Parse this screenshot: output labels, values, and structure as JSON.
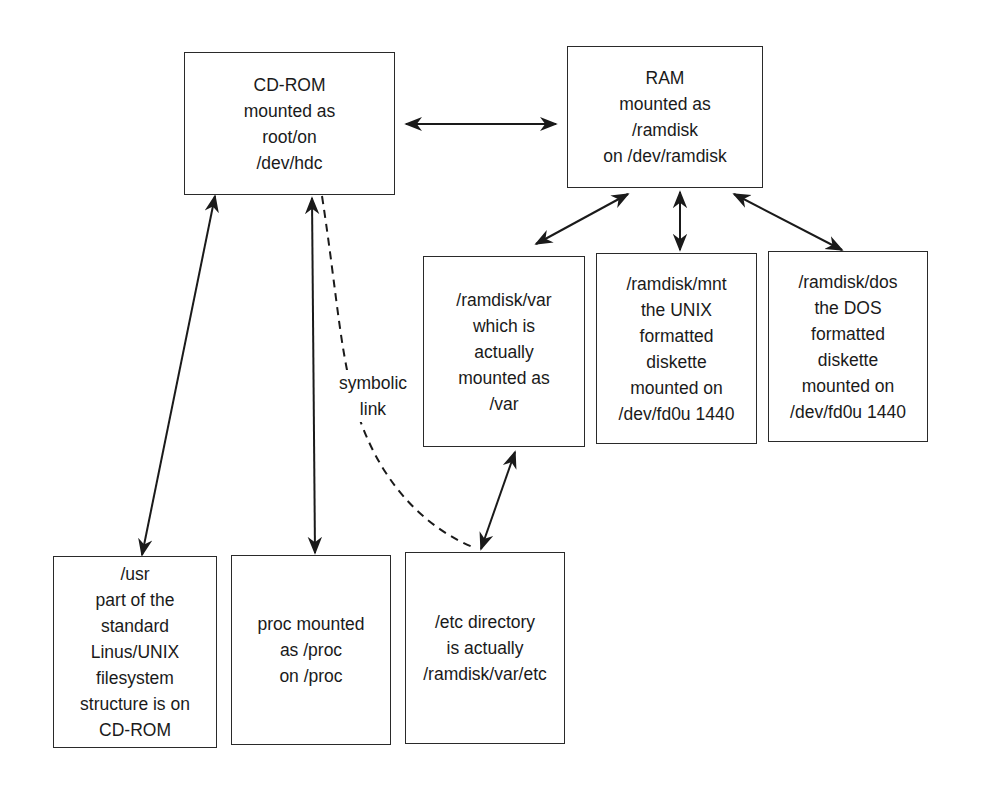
{
  "diagram": {
    "nodes": {
      "cdrom": {
        "lines": [
          "CD-ROM",
          "mounted as",
          "root/on",
          "/dev/hdc"
        ]
      },
      "ram": {
        "lines": [
          "RAM",
          "mounted as",
          "/ramdisk",
          "on /dev/ramdisk"
        ]
      },
      "ramdisk_var": {
        "lines": [
          "/ramdisk/var",
          "which is",
          "actually",
          "mounted as",
          "/var"
        ]
      },
      "ramdisk_mnt": {
        "lines": [
          "/ramdisk/mnt",
          "the UNIX",
          "formatted",
          "diskette",
          "mounted on",
          "/dev/fd0u 1440"
        ]
      },
      "ramdisk_dos": {
        "lines": [
          "/ramdisk/dos",
          "the DOS",
          "formatted",
          "diskette",
          "mounted on",
          "/dev/fd0u 1440"
        ]
      },
      "usr": {
        "lines": [
          "/usr",
          "part of the",
          "standard",
          "Linus/UNIX",
          "filesystem",
          "structure is on",
          "CD-ROM"
        ]
      },
      "proc": {
        "lines": [
          "proc mounted",
          "as /proc",
          "on /proc"
        ]
      },
      "etc": {
        "lines": [
          "/etc directory",
          "is actually",
          "/ramdisk/var/etc"
        ]
      }
    },
    "edge_labels": {
      "symbolic_link": {
        "lines": [
          "symbolic",
          "link"
        ]
      }
    },
    "edges": [
      {
        "from": "cdrom",
        "to": "ram",
        "style": "solid",
        "arrows": "both"
      },
      {
        "from": "ram",
        "to": "ramdisk_var",
        "style": "solid",
        "arrows": "both"
      },
      {
        "from": "ram",
        "to": "ramdisk_mnt",
        "style": "solid",
        "arrows": "both"
      },
      {
        "from": "ram",
        "to": "ramdisk_dos",
        "style": "solid",
        "arrows": "both"
      },
      {
        "from": "cdrom",
        "to": "usr",
        "style": "solid",
        "arrows": "both"
      },
      {
        "from": "cdrom",
        "to": "proc",
        "style": "solid",
        "arrows": "both"
      },
      {
        "from": "cdrom",
        "to": "etc",
        "style": "dashed",
        "arrows": "none",
        "label": "symbolic link"
      },
      {
        "from": "ramdisk_var",
        "to": "etc",
        "style": "solid",
        "arrows": "both"
      }
    ],
    "colors": {
      "line": "#1a1a1a",
      "background": "#ffffff"
    }
  }
}
